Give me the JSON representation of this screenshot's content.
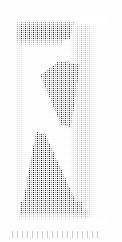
{
  "image": {
    "kind": "scanned-halftone-figure",
    "title": "",
    "caption": "",
    "width_px": 122,
    "height_px": 242,
    "page_background": "#fdfdfd",
    "panel": {
      "left_px": 14,
      "top_px": 17,
      "width_px": 94,
      "height_px": 208,
      "ground_color": "#f4f4f4",
      "dither_cell_px": 2,
      "dither_pattern": "orthogonal-halftone-grid"
    },
    "subject": {
      "description": "dark angular glyph",
      "ink_color": "#2e2e2e",
      "strokes": [
        {
          "name": "top-bar",
          "shape": "tapered-horizontal-bar",
          "tone": "#2e2e2e"
        },
        {
          "name": "upper-wedge",
          "shape": "descending-diagonal-wedge",
          "tone": "#343434"
        },
        {
          "name": "lower-triangle",
          "shape": "large-right-triangle",
          "tone": "#2b2b2b"
        },
        {
          "name": "bottom-band",
          "shape": "horizontal-footing-band",
          "tone": "#3a3a3a"
        }
      ]
    },
    "tone_bands": [
      {
        "name": "right-gradient-band",
        "tone": "#5f5f5f",
        "orientation": "vertical"
      },
      {
        "name": "left-margin-band",
        "tone": "#6e6e6e",
        "orientation": "vertical"
      }
    ],
    "caption_strip": {
      "present": true,
      "legible": false,
      "note": ""
    }
  }
}
